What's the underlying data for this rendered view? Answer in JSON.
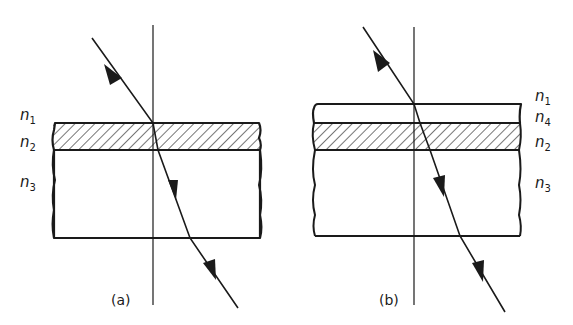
{
  "figure": {
    "panels": [
      {
        "id": "a",
        "caption": "(a)",
        "labels": [
          {
            "base": "n",
            "sub": "1"
          },
          {
            "base": "n",
            "sub": "2"
          },
          {
            "base": "n",
            "sub": "3"
          }
        ],
        "layers": [
          "n1 (incident medium)",
          "n2 (hatched thin film)",
          "n3 (substrate)"
        ]
      },
      {
        "id": "b",
        "caption": "(b)",
        "labels": [
          {
            "base": "n",
            "sub": "1"
          },
          {
            "base": "n",
            "sub": "4"
          },
          {
            "base": "n",
            "sub": "2"
          },
          {
            "base": "n",
            "sub": "3"
          }
        ],
        "layers": [
          "n1 (incident medium)",
          "n4 (overlayer)",
          "n2 (hatched thin film)",
          "n3 (substrate)"
        ]
      }
    ],
    "colors": {
      "line": "#1a1a1a",
      "background": "#ffffff"
    }
  }
}
